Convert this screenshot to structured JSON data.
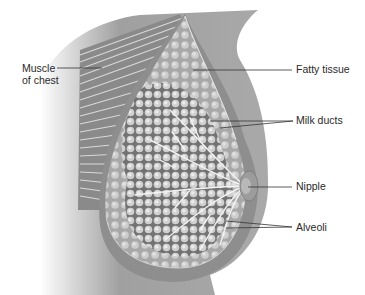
{
  "diagram": {
    "labels": {
      "muscle_line1": "Muscle",
      "muscle_line2": "of chest",
      "fatty_tissue": "Fatty tissue",
      "milk_ducts": "Milk ducts",
      "nipple": "Nipple",
      "alveoli": "Alveoli"
    },
    "colors": {
      "skin": "#8a8a8a",
      "tissue": "#b5b5b5",
      "lobule": "#d8d8d8",
      "muscle": "#7a7a7a",
      "leader": "#333333",
      "text": "#2a2a2a"
    }
  }
}
